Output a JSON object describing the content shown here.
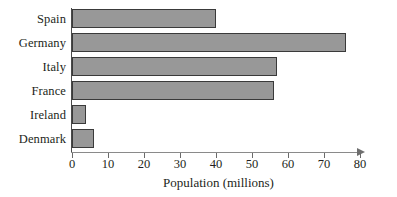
{
  "chart_data": {
    "type": "bar",
    "orientation": "horizontal",
    "title": "",
    "xlabel": "Population (millions)",
    "ylabel": "",
    "categories": [
      "Spain",
      "Germany",
      "Italy",
      "France",
      "Ireland",
      "Denmark"
    ],
    "values": [
      40,
      76,
      57,
      56,
      4,
      6
    ],
    "series": [
      {
        "name": "Population",
        "values": [
          40,
          76,
          57,
          56,
          4,
          6
        ]
      }
    ],
    "xlim": [
      0,
      80
    ],
    "xticks": [
      0,
      10,
      20,
      30,
      40,
      50,
      60,
      70,
      80
    ],
    "xtick_labels": [
      "0",
      "10",
      "20",
      "30",
      "40",
      "50",
      "60",
      "70",
      "80"
    ],
    "grid": false,
    "legend": false,
    "bar_color": "#989898",
    "bar_border_color": "#3a3a3a",
    "axis_color": "#6a6a6a",
    "background_color": "#ffffff",
    "x_axis_has_arrow": true
  }
}
